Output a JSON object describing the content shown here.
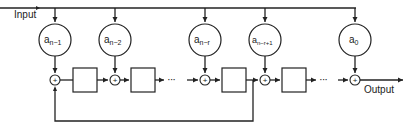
{
  "diagram": {
    "type": "block-diagram",
    "input_label": "Input",
    "output_label": "Output",
    "coefficients": [
      {
        "base": "a",
        "subscript": "n−1"
      },
      {
        "base": "a",
        "subscript": "n−2"
      },
      {
        "base": "a",
        "subscript": "n−r"
      },
      {
        "base": "a",
        "subscript": "n−r+1"
      },
      {
        "base": "a",
        "subscript": "0"
      }
    ],
    "summing_symbol": "+",
    "ellipsis": "···",
    "delay_blocks": 4,
    "colors": {
      "stroke": "#222222",
      "background": "#ffffff"
    }
  }
}
